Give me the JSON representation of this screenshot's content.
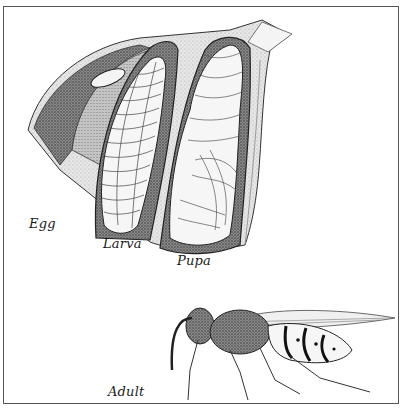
{
  "figure": {
    "labels": {
      "egg": "Egg",
      "larva": "Larva",
      "pupa": "Pupa",
      "adult": "Adult"
    },
    "colors": {
      "ink": "#1a1a1a",
      "stipple_dark": "#6e6e6e",
      "stipple_mid": "#a8a8a8",
      "stipple_light": "#d4d4d4",
      "paper": "#ffffff",
      "frame": "#555555"
    }
  }
}
